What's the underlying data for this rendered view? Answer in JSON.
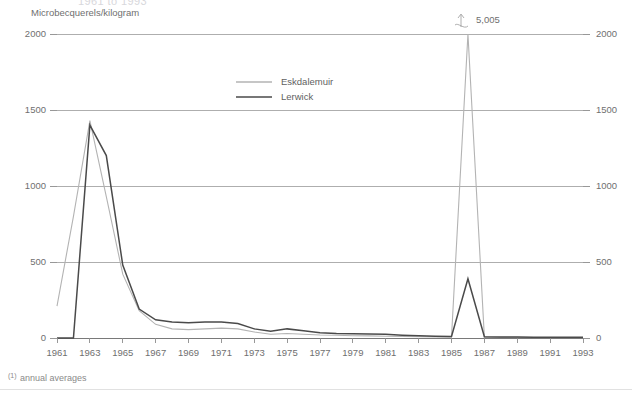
{
  "title": "1961 to 1993",
  "y_axis_unit_label": "Microbecquerels/kilogram",
  "footnote": {
    "marker": "(1)",
    "text": "annual averages"
  },
  "legend": {
    "position": "top-center",
    "items": [
      {
        "label": "Eskdalemuir",
        "color": "#b3b3b3"
      },
      {
        "label": "Lerwick",
        "color": "#4a4a4a"
      }
    ]
  },
  "annotation": {
    "label": "5,005",
    "icon": "break-arrow-icon",
    "series": "Lerwick",
    "year": 1986,
    "value": 5005
  },
  "axes": {
    "y_ticks": [
      "0",
      "500",
      "1000",
      "1500",
      "2000"
    ],
    "y_ticks_right": [
      "0",
      "500",
      "1000",
      "1500",
      "2000"
    ],
    "x_ticks": [
      "1961",
      "1963",
      "1965",
      "1967",
      "1969",
      "1971",
      "1973",
      "1975",
      "1977",
      "1979",
      "1981",
      "1983",
      "1985",
      "1987",
      "1989",
      "1991",
      "1993"
    ]
  },
  "chart_data": {
    "type": "line",
    "title": "1961 to 1993",
    "xlabel": "",
    "ylabel": "Microbecquerels/kilogram",
    "xlim": [
      1961,
      1993
    ],
    "ylim": [
      0,
      2000
    ],
    "grid": true,
    "legend_position": "top-center",
    "annotations": [
      {
        "text": "5,005",
        "series": "Lerwick",
        "x": 1986,
        "y": 2000,
        "note": "value clipped at axis top; true value 5,005"
      }
    ],
    "x": [
      1961,
      1962,
      1963,
      1964,
      1965,
      1966,
      1967,
      1968,
      1969,
      1970,
      1971,
      1972,
      1973,
      1974,
      1975,
      1976,
      1977,
      1978,
      1979,
      1980,
      1981,
      1982,
      1983,
      1984,
      1985,
      1986,
      1987,
      1988,
      1989,
      1990,
      1991,
      1992,
      1993
    ],
    "series": [
      {
        "name": "Eskdalemuir",
        "color": "#b3b3b3",
        "values": [
          210,
          800,
          1430,
          930,
          420,
          180,
          90,
          60,
          55,
          60,
          65,
          60,
          40,
          25,
          30,
          25,
          20,
          18,
          15,
          14,
          12,
          10,
          8,
          7,
          6,
          2000,
          5,
          4,
          4,
          3,
          3,
          3,
          3
        ]
      },
      {
        "name": "Lerwick",
        "color": "#4a4a4a",
        "values": [
          0,
          0,
          1400,
          1200,
          480,
          190,
          120,
          105,
          100,
          105,
          105,
          95,
          60,
          45,
          60,
          48,
          35,
          30,
          28,
          26,
          24,
          18,
          14,
          12,
          10,
          390,
          8,
          6,
          6,
          5,
          5,
          5,
          5
        ]
      }
    ]
  }
}
